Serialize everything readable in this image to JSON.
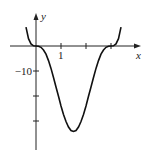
{
  "chart_data": {
    "type": "line",
    "title": "",
    "xlabel": "x",
    "ylabel": "y",
    "xlim": [
      -0.45,
      4.0
    ],
    "ylim": [
      -40,
      11
    ],
    "x_ticks": [
      1,
      2,
      3
    ],
    "x_tick_labels": [
      "1",
      "",
      ""
    ],
    "y_ticks": [
      -10,
      -20,
      -30
    ],
    "y_tick_labels": [
      "−10",
      "",
      ""
    ],
    "grid": false,
    "legend": "none",
    "series": [
      {
        "name": "f(x)",
        "x": [
          -0.4,
          -0.3,
          -0.2,
          -0.1,
          0,
          0.1,
          0.2,
          0.3,
          0.4,
          0.5,
          0.6,
          0.7,
          0.8,
          0.9,
          1.0,
          1.1,
          1.2,
          1.3,
          1.4,
          1.5,
          1.6,
          1.7,
          1.8,
          1.9,
          2.0,
          2.1,
          2.2,
          2.3,
          2.4,
          2.5,
          2.6,
          2.7,
          2.8,
          2.9,
          3.0,
          3.1,
          3.2,
          3.3,
          3.4
        ],
        "y": [
          7.55,
          2.91,
          0.84,
          0.1,
          0,
          -0.08,
          -0.53,
          -1.59,
          -3.29,
          -5.86,
          -8.96,
          -12.6,
          -16.4,
          -20.1,
          -24.0,
          -27.4,
          -30.2,
          -32.4,
          -33.8,
          -34.2,
          -33.8,
          -32.4,
          -30.2,
          -27.4,
          -24.0,
          -20.1,
          -16.4,
          -12.6,
          -8.96,
          -5.86,
          -3.29,
          -1.59,
          -0.53,
          -0.08,
          0,
          0.1,
          0.84,
          2.91,
          7.55
        ]
      }
    ]
  }
}
